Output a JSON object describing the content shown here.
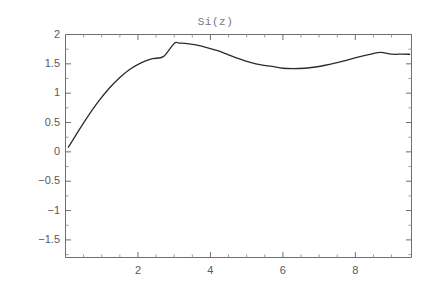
{
  "figure": {
    "clipped_caption": "",
    "title": "Si(z)"
  },
  "chart_data": {
    "type": "line",
    "title": "Si(z)",
    "xlabel": "",
    "ylabel": "",
    "xlim": [
      0.0,
      9.55
    ],
    "ylim": [
      -1.8,
      2.0
    ],
    "grid": false,
    "legend": null,
    "axis_frame": true,
    "x_ticks_major": [
      2,
      4,
      6,
      8
    ],
    "x_tick_labels": [
      "2",
      "4",
      "6",
      "8"
    ],
    "x_ticks_minor": [
      0.5,
      1,
      1.5,
      2.5,
      3,
      3.5,
      4.5,
      5,
      5.5,
      6.5,
      7,
      7.5,
      8.5,
      9
    ],
    "y_ticks_major": [
      2,
      1.5,
      1,
      0.5,
      0,
      -0.5,
      -1,
      -1.5
    ],
    "y_tick_labels": [
      "2",
      "1.5",
      "1",
      "0.5",
      "0",
      "-0.5",
      "-1",
      "-1.5"
    ],
    "y_ticks_minor": [
      1.75,
      1.25,
      0.75,
      0.25,
      -0.25,
      -0.75,
      -1.25,
      -1.75
    ],
    "series": [
      {
        "name": "Si(z)",
        "color": "#2b2b2b",
        "linewidth": 1.3,
        "x": [
          0.08,
          0.3,
          0.6,
          0.9,
          1.2,
          1.5,
          1.8,
          2.1,
          2.4,
          2.7,
          3.0,
          3.14159,
          3.3,
          3.6,
          3.9,
          4.2,
          4.5,
          4.8,
          5.1,
          5.4,
          5.7,
          6.0,
          6.28319,
          6.6,
          6.9,
          7.2,
          7.5,
          7.8,
          8.1,
          8.4,
          8.7,
          9.0,
          9.3,
          9.5
        ],
        "y": [
          0.08,
          0.2996,
          0.5881,
          0.8518,
          1.0805,
          1.2687,
          1.4155,
          1.5213,
          1.5889,
          1.6225,
          1.8487,
          1.8519,
          1.8486,
          1.8219,
          1.7778,
          1.7239,
          1.6541,
          1.5849,
          1.5267,
          1.4831,
          1.4556,
          1.4247,
          1.4182,
          1.4246,
          1.4464,
          1.4801,
          1.5224,
          1.5696,
          1.6171,
          1.6603,
          1.6955,
          1.665,
          1.665,
          1.6635
        ]
      }
    ],
    "annotations": [
      {
        "label": "local maximum",
        "x": 3.14159,
        "y": 1.852
      },
      {
        "label": "local minimum",
        "x": 6.28319,
        "y": 1.418
      }
    ]
  }
}
